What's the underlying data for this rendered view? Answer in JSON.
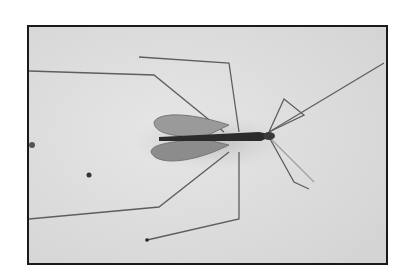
{
  "photo": {
    "subject": "long-legged fly (crane fly) resting on a pale surface",
    "style": "grayscale photograph with black border",
    "colors": {
      "page_background": "#ffffff",
      "frame_border": "#1a1a1a",
      "surface": "#dcdcdc",
      "body": "#2b2b2b",
      "wings": "#8e8e8e",
      "legs": "#5a5a5a"
    }
  }
}
